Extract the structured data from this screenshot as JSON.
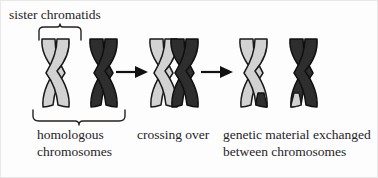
{
  "figure": {
    "background_color": "#fdfdfd",
    "border_color": "#e8e8e8"
  },
  "labels": {
    "sister_chromatids": "sister chromatids",
    "homologous_line1": "homologous",
    "homologous_line2": "chromosomes",
    "crossing_over": "crossing over",
    "genetic_exchange_line1": "genetic material exchanged",
    "genetic_exchange_line2": "between chromosomes"
  },
  "colors": {
    "light_chromatid": "#d2d2d2",
    "dark_chromatid": "#2e2e2e",
    "outline": "#1a1a1a",
    "text": "#27231f",
    "arrow": "#111111"
  },
  "stages": [
    {
      "id": "stage-1",
      "name": "homologous-chromosomes",
      "caption": "homologous chromosomes",
      "chromosomes": [
        {
          "name": "maternal-chromosome",
          "shade": "light",
          "recombinant": false
        },
        {
          "name": "paternal-chromosome",
          "shade": "dark",
          "recombinant": false
        }
      ],
      "brace_top": "sister chromatids",
      "brace_bottom": "homologous chromosomes"
    },
    {
      "id": "stage-2",
      "name": "crossing-over",
      "caption": "crossing over",
      "chromosomes": [
        {
          "name": "maternal-chromosome",
          "shade": "light",
          "recombinant": false
        },
        {
          "name": "paternal-chromosome",
          "shade": "dark",
          "recombinant": false
        }
      ],
      "overlap": true
    },
    {
      "id": "stage-3",
      "name": "recombinant-chromosomes",
      "caption": "genetic material exchanged between chromosomes",
      "chromosomes": [
        {
          "name": "recombinant-chromosome-light",
          "shade": "light",
          "recombinant": true,
          "tip_shade": "dark"
        },
        {
          "name": "recombinant-chromosome-dark",
          "shade": "dark",
          "recombinant": true,
          "tip_shade": "light"
        }
      ]
    }
  ],
  "arrows": [
    {
      "name": "arrow-stage1-to-stage2",
      "direction": "right"
    },
    {
      "name": "arrow-stage2-to-stage3",
      "direction": "right"
    }
  ]
}
